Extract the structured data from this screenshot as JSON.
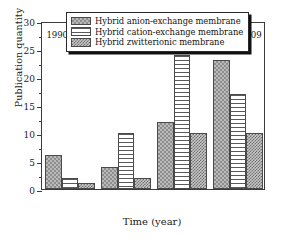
{
  "chart_data": {
    "type": "bar",
    "title": "",
    "xlabel": "Time (year)",
    "ylabel": "Publication quantity",
    "categories": [
      "1990–1995",
      "1996–2000",
      "2001–2005",
      "2006–2009"
    ],
    "series": [
      {
        "name": "Hybrid anion-exchange membrane",
        "values": [
          6,
          4,
          12,
          23
        ],
        "pattern": "light-checkerboard"
      },
      {
        "name": "Hybrid cation-exchange membrane",
        "values": [
          2,
          10,
          24,
          17
        ],
        "pattern": "horizontal-lines"
      },
      {
        "name": "Hybrid zwitterionic membrane",
        "values": [
          1,
          2,
          10,
          10
        ],
        "pattern": "dense-checkerboard"
      }
    ],
    "ylim": [
      0,
      30
    ],
    "yticks": [
      0,
      5,
      10,
      15,
      20,
      25,
      30
    ],
    "ytick_labels": [
      "0",
      "5",
      "10",
      "15",
      "20",
      "25",
      "30"
    ],
    "yminor_ticks": [
      2.5,
      7.5,
      12.5,
      17.5,
      22.5,
      27.5
    ],
    "grid": false,
    "legend_position": "top-center"
  },
  "legend": {
    "items": [
      {
        "label": "Hybrid anion-exchange membrane",
        "swatch": "light-checkerboard"
      },
      {
        "label": "Hybrid cation-exchange membrane",
        "swatch": "horizontal-lines"
      },
      {
        "label": "Hybrid zwitterionic membrane",
        "swatch": "dense-checkerboard"
      }
    ]
  },
  "colors": {
    "axis": "#3b3b3b",
    "bar_edge": "#4a4a4a",
    "legend_border": "#2a2a2a",
    "legend_shadow": "#111111",
    "text": "#1a1a1a",
    "background": "#ffffff"
  }
}
